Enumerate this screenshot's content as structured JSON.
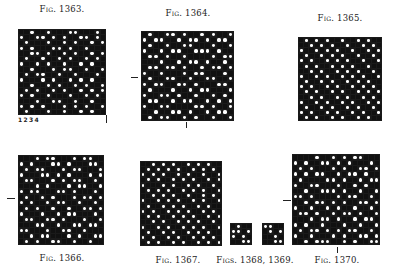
{
  "figures": [
    {
      "id": "fig1363",
      "caption": "Fig. 1363.",
      "cap_x": 62,
      "cap_y": 4,
      "x": 18,
      "y": 29,
      "w": 88,
      "h": 86,
      "rows": [
        "1101101110011101",
        "0110010101100101",
        "1011101101011010",
        "0101110010110111",
        "1100101101011010",
        "1011011010110101",
        "0110101101101011",
        "1101110100110110",
        "1010011011011101",
        "0111010110101011",
        "1101101011010110",
        "1010110101101010",
        "0101101110110101",
        "1110110011011011",
        "0101011101010110",
        "1011101101101011"
      ]
    },
    {
      "id": "fig1364",
      "caption": "Fig. 1364.",
      "cap_x": 188,
      "cap_y": 8,
      "x": 141,
      "y": 31,
      "w": 93,
      "h": 90,
      "rows": [
        "1011001011010110",
        "0100110100101001",
        "1011011001110110",
        "0110100110001011",
        "1001011011110100",
        "1110110100101101",
        "1001001011010010",
        "0110111010011101",
        "1011001101100110",
        "0100110010111001",
        "1011101101001110",
        "0110010110110101",
        "1001101001101010",
        "0110011110010110",
        "1101100101101001",
        "1010011010110110"
      ]
    },
    {
      "id": "fig1365",
      "caption": "Fig. 1365.",
      "cap_x": 340,
      "cap_y": 13,
      "x": 298,
      "y": 37,
      "w": 84,
      "h": 84,
      "rows": [
        "1010101101101011",
        "1101010110110101",
        "0110101011011010",
        "1011010101101101",
        "0101101010110110",
        "1010110101011011",
        "1101011010101101",
        "0110101101010110",
        "1011010110101011",
        "0101101011010101",
        "1010110101101010",
        "1101011010110101",
        "0110101101011010",
        "1011010110101101",
        "0101101011010110",
        "1010110101101011"
      ]
    },
    {
      "id": "fig1366",
      "caption": "Fig. 1366.",
      "cap_x": 62,
      "cap_y": 253,
      "x": 18,
      "y": 155,
      "w": 86,
      "h": 90,
      "rows": [
        "1110100111010011",
        "0101110010111001",
        "1010011101001110",
        "0111001010111010",
        "1001110101001101",
        "1110101110100110",
        "0100111001011101",
        "1011010111010010",
        "0101101001101101",
        "1010110110110010",
        "0111011010011101",
        "1001100101110110",
        "1110011011001001",
        "0011101100110111",
        "1101001110101100",
        "1010110011011011"
      ]
    },
    {
      "id": "fig1367",
      "caption": "Fig. 1367.",
      "cap_x": 178,
      "cap_y": 255,
      "x": 140,
      "y": 161,
      "w": 82,
      "h": 85,
      "rows": [
        "1101010110101011",
        "1010101011010101",
        "0101011010110110",
        "1010110101011010",
        "0111010110101101",
        "1010101101010110",
        "1101010110110101",
        "0110101011010110",
        "1011010101101011",
        "0101101010110101",
        "1010110101011010",
        "1101011010101101",
        "0110101101010110",
        "1011010110101011",
        "0101101011010101",
        "1010110101101010"
      ]
    },
    {
      "id": "fig1368",
      "caption": "",
      "x": 230,
      "y": 223,
      "w": 22,
      "h": 22,
      "rows": [
        "1011",
        "0010",
        "0101",
        "1100"
      ]
    },
    {
      "id": "fig1369",
      "caption": "",
      "x": 262,
      "y": 223,
      "w": 22,
      "h": 22,
      "rows": [
        "0011",
        "1010",
        "1101",
        "1100"
      ]
    },
    {
      "id": "fig1370",
      "caption": "Fig. 1370.",
      "cap_x": 337,
      "cap_y": 255,
      "x": 292,
      "y": 154,
      "w": 88,
      "h": 91,
      "rows": [
        "1111011010100111",
        "0101100101011101",
        "1010111010110010",
        "0101001101001011",
        "1011110010110100",
        "0110011101101011",
        "1101100010110110",
        "0010111101001101",
        "1101001010110010",
        "0110110101101101",
        "1001011010010110",
        "1110100101101001",
        "0101101110110110",
        "1010010101001101",
        "0110111010110010",
        "1101000110101100"
      ]
    }
  ],
  "captions_extra": [
    {
      "id": "figs1368_1369",
      "text": "Figs. 1368, 1369.",
      "x": 255,
      "y": 255
    }
  ],
  "numbers_1363": "1234",
  "marks": {
    "h": [
      {
        "x": 131,
        "y": 77,
        "w": 7
      },
      {
        "x": 7,
        "y": 198,
        "w": 8
      },
      {
        "x": 283,
        "y": 200,
        "w": 8
      }
    ],
    "v": [
      {
        "x": 106,
        "y": 115,
        "h": 8
      },
      {
        "x": 186,
        "y": 122,
        "h": 6
      },
      {
        "x": 337,
        "y": 247,
        "h": 6
      }
    ]
  }
}
